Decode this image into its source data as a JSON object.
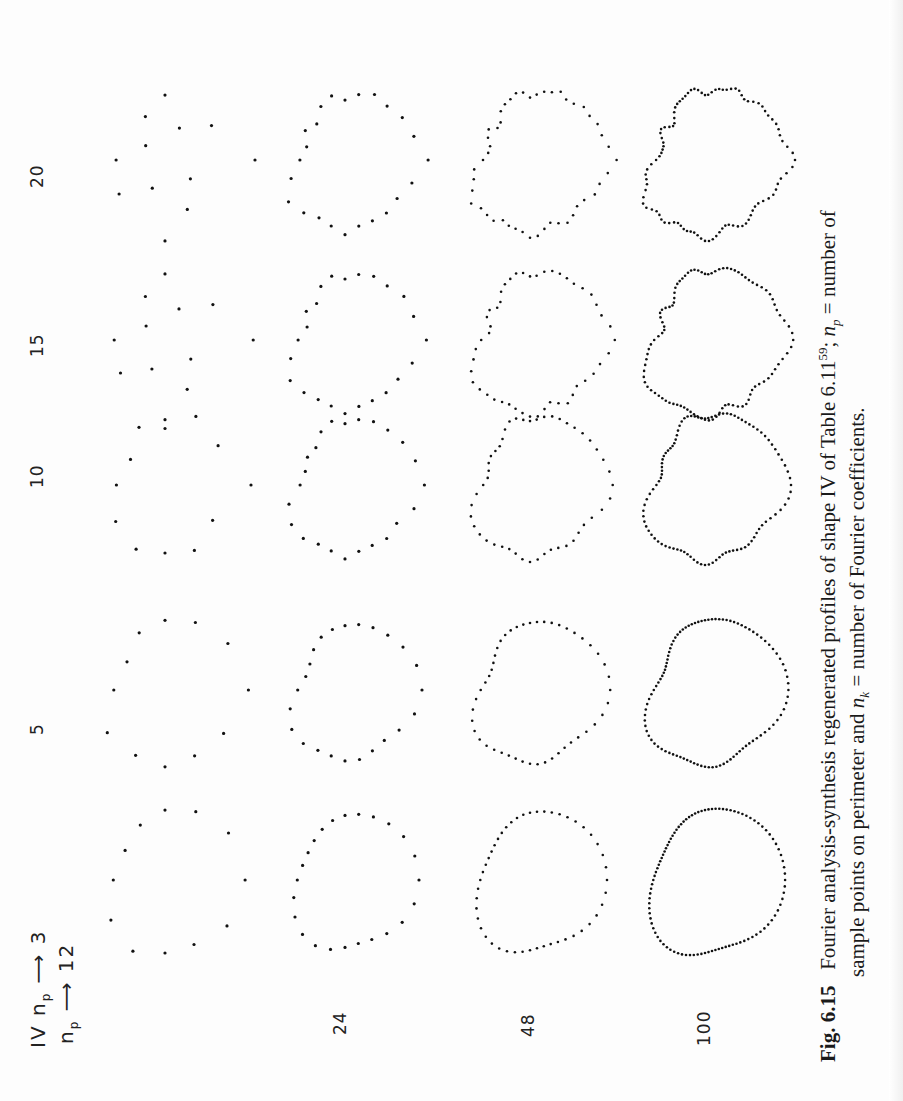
{
  "figure": {
    "shape_label": "IV",
    "np_symbol": "n",
    "np_subscript": "p",
    "column_header_title": "n_p → 3",
    "row_header_title": "n_p ↓",
    "column_labels": [
      "3",
      "5",
      "10",
      "15",
      "20"
    ],
    "row_labels": [
      "12",
      "24",
      "48",
      "100"
    ]
  },
  "caption": {
    "fig_number": "Fig. 6.15",
    "line1_a": "Fourier analysis-synthesis regenerated profiles of shape IV of Table  6.11",
    "line1_sup": "59",
    "line1_b": "; ",
    "line1_np": "n",
    "line1_np_sub": "p",
    "line1_c": " = number of",
    "line2_a": "sample points on perimeter and ",
    "line2_nk": "n",
    "line2_nk_sub": "k",
    "line2_b": " = number of  Fourier coefficients."
  },
  "chart_data": {
    "type": "scatter",
    "layout": "grid of dotted closed profiles, rotated 90° counter-clockwise on page",
    "row_variable": "n_p (sample points on perimeter)",
    "column_variable": "n_k (Fourier coefficients)",
    "rows": [
      12,
      24,
      48,
      100
    ],
    "columns": [
      3,
      5,
      10,
      15,
      20
    ],
    "cells": [
      {
        "n_p": 12,
        "n_k": 3,
        "points": 12,
        "shape": "rounded triangle (smooth)"
      },
      {
        "n_p": 12,
        "n_k": 5,
        "points": 12,
        "shape": "rounded triangle"
      },
      {
        "n_p": 12,
        "n_k": 10,
        "points": 12,
        "shape": "irregular triangle"
      },
      {
        "n_p": 12,
        "n_k": 15,
        "points": 12,
        "shape": "scattered, aliased"
      },
      {
        "n_p": 12,
        "n_k": 20,
        "points": 12,
        "shape": "scattered, aliased"
      },
      {
        "n_p": 24,
        "n_k": 3,
        "points": 24,
        "shape": "rounded triangle"
      },
      {
        "n_p": 24,
        "n_k": 5,
        "points": 24,
        "shape": "rounded triangle with lobe"
      },
      {
        "n_p": 24,
        "n_k": 10,
        "points": 24,
        "shape": "rounded with lobe"
      },
      {
        "n_p": 24,
        "n_k": 15,
        "points": 24,
        "shape": "rounded with lobe"
      },
      {
        "n_p": 24,
        "n_k": 20,
        "points": 24,
        "shape": "rounded with lobe"
      },
      {
        "n_p": 48,
        "n_k": 3,
        "points": 48,
        "shape": "pear-like"
      },
      {
        "n_p": 48,
        "n_k": 5,
        "points": 48,
        "shape": "pear-like with notch"
      },
      {
        "n_p": 48,
        "n_k": 10,
        "points": 48,
        "shape": "pear-like, wavy"
      },
      {
        "n_p": 48,
        "n_k": 15,
        "points": 48,
        "shape": "pear-like, wavy"
      },
      {
        "n_p": 48,
        "n_k": 20,
        "points": 48,
        "shape": "pear-like, wavy"
      },
      {
        "n_p": 100,
        "n_k": 3,
        "points": 100,
        "shape": "pear-like"
      },
      {
        "n_p": 100,
        "n_k": 5,
        "points": 100,
        "shape": "pear-like with notch"
      },
      {
        "n_p": 100,
        "n_k": 10,
        "points": 100,
        "shape": "irregular, wavy"
      },
      {
        "n_p": 100,
        "n_k": 15,
        "points": 100,
        "shape": "irregular, wavy"
      },
      {
        "n_p": 100,
        "n_k": 20,
        "points": 100,
        "shape": "irregular, wavy"
      }
    ],
    "xlabel": "n_k",
    "ylabel": "n_p",
    "grid": false,
    "legend": null
  }
}
